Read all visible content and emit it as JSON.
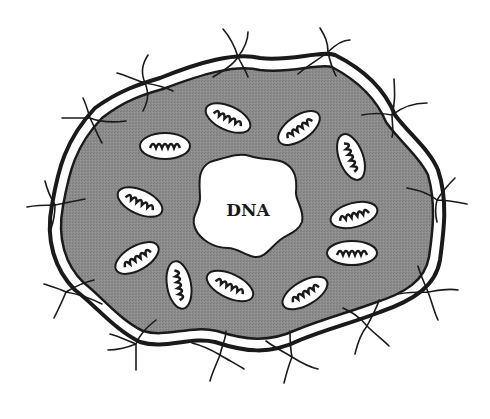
{
  "diagram": {
    "nucleus_label": "DNA",
    "colors": {
      "background": "#ffffff",
      "cytoplasm": "#8a8a8a",
      "membrane_line": "#1a1a1a",
      "membrane_gap": "#ffffff",
      "mitochondria_fill": "#ffffff",
      "dna_region": "#ffffff"
    },
    "components": {
      "cell_membrane": "double-line outer boundary",
      "cytoplasm": "grey stippled region",
      "nucleus_region": "white irregular area labeled DNA",
      "mitochondria_count": 13,
      "receptor_count": 16
    }
  }
}
